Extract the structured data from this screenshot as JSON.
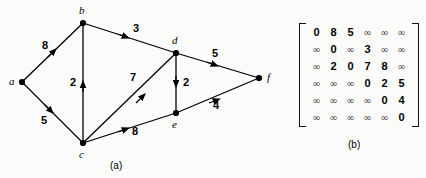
{
  "figure": {
    "background_color": "#fbfbf9",
    "ink_color": "#000000"
  },
  "graph": {
    "caption": "(a)",
    "nodes": [
      {
        "id": "a",
        "label": "a",
        "x": 22,
        "y": 82,
        "label_x": 9,
        "label_y": 76
      },
      {
        "id": "b",
        "label": "b",
        "x": 83,
        "y": 23,
        "label_x": 79,
        "label_y": 5
      },
      {
        "id": "c",
        "label": "c",
        "x": 83,
        "y": 143,
        "label_x": 79,
        "label_y": 149
      },
      {
        "id": "d",
        "label": "d",
        "x": 176,
        "y": 53,
        "label_x": 172,
        "label_y": 35
      },
      {
        "id": "e",
        "label": "e",
        "x": 176,
        "y": 113,
        "label_x": 172,
        "label_y": 119
      },
      {
        "id": "f",
        "label": "f",
        "x": 259,
        "y": 78,
        "label_x": 267,
        "label_y": 72
      }
    ],
    "edges": [
      {
        "id": "a-b",
        "from": "a",
        "to": "b",
        "weight": "8",
        "label_x": 42,
        "label_y": 40
      },
      {
        "id": "a-c",
        "from": "a",
        "to": "c",
        "weight": "5",
        "label_x": 41,
        "label_y": 115
      },
      {
        "id": "b-d",
        "from": "b",
        "to": "d",
        "weight": "3",
        "label_x": 133,
        "label_y": 23
      },
      {
        "id": "c-b",
        "from": "c",
        "to": "b",
        "weight": "2",
        "label_x": 70,
        "label_y": 77
      },
      {
        "id": "c-d",
        "from": "c",
        "to": "d",
        "weight": "7",
        "label_x": 130,
        "label_y": 72
      },
      {
        "id": "c-e",
        "from": "c",
        "to": "e",
        "weight": "8",
        "label_x": 132,
        "label_y": 126
      },
      {
        "id": "d-e",
        "from": "d",
        "to": "e",
        "weight": "2",
        "label_x": 183,
        "label_y": 77
      },
      {
        "id": "d-f",
        "from": "d",
        "to": "f",
        "weight": "5",
        "label_x": 212,
        "label_y": 48
      },
      {
        "id": "e-f",
        "from": "e",
        "to": "f",
        "weight": "4",
        "label_x": 213,
        "label_y": 100
      }
    ]
  },
  "matrix": {
    "caption": "(b)",
    "infinity_symbol": "∞",
    "rows": [
      [
        "0",
        "8",
        "5",
        "∞",
        "∞",
        "∞"
      ],
      [
        "∞",
        "0",
        "∞",
        "3",
        "∞",
        "∞"
      ],
      [
        "∞",
        "2",
        "0",
        "7",
        "8",
        "∞"
      ],
      [
        "∞",
        "∞",
        "∞",
        "0",
        "2",
        "5"
      ],
      [
        "∞",
        "∞",
        "∞",
        "∞",
        "0",
        "4"
      ],
      [
        "∞",
        "∞",
        "∞",
        "∞",
        "∞",
        "0"
      ]
    ]
  }
}
